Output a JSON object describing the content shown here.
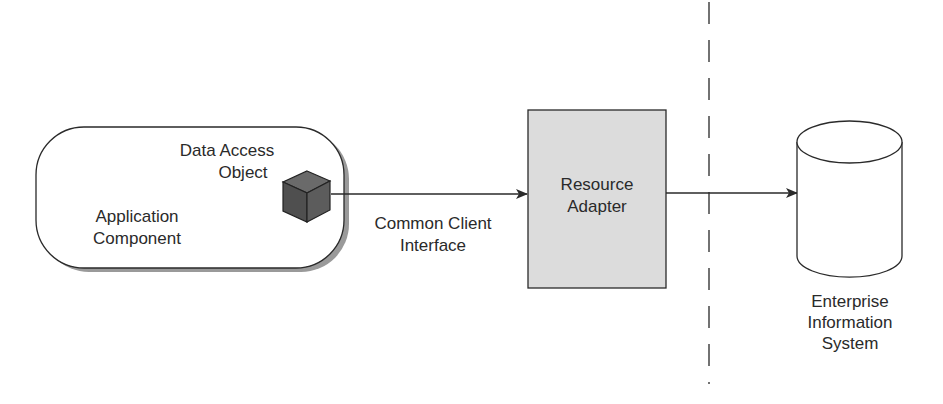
{
  "diagram": {
    "application_component": {
      "label_line1": "Application",
      "label_line2": "Component"
    },
    "data_access_object": {
      "label_line1": "Data Access",
      "label_line2": "Object",
      "icon": "cube-icon"
    },
    "connector_cci": {
      "label_line1": "Common Client",
      "label_line2": "Interface"
    },
    "resource_adapter": {
      "label_line1": "Resource",
      "label_line2": "Adapter"
    },
    "eis": {
      "label_line1": "Enterprise",
      "label_line2": "Information",
      "label_line3": "System",
      "icon": "database-cylinder-icon"
    },
    "boundary": {
      "style": "dashed"
    },
    "colors": {
      "stroke": "#2a2a2a",
      "adapter_fill": "#dcdcdc",
      "cube_fill": "#555555",
      "shadow": "#9a9a9a"
    }
  }
}
